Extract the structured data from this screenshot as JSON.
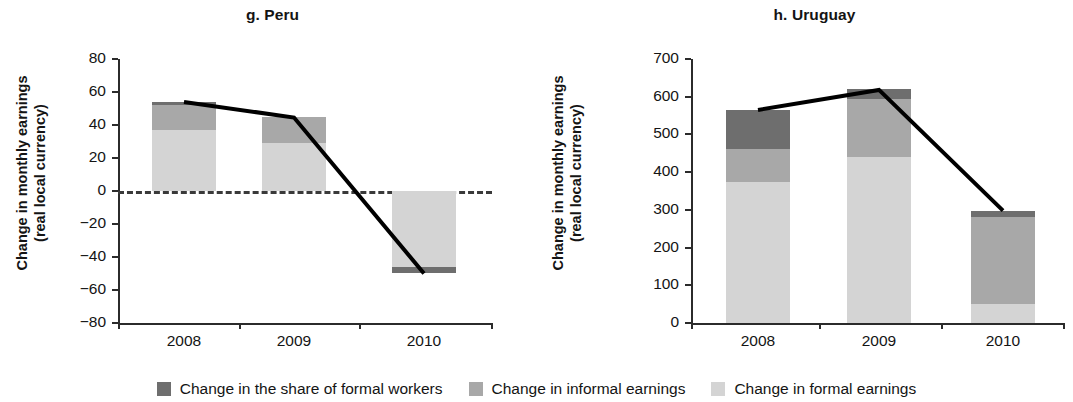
{
  "figure": {
    "panels": [
      {
        "key": "peru",
        "title": "g. Peru",
        "ylabel_line1": "Change in monthly earnings",
        "ylabel_line2": "(real local currency)"
      },
      {
        "key": "uruguay",
        "title": "h. Uruguay",
        "ylabel_line1": "Change in monthly earnings",
        "ylabel_line2": "(real local currency)"
      }
    ],
    "legend": {
      "items": [
        {
          "label": "Change in the share of formal workers",
          "color": "#6e6e6e",
          "key": "share"
        },
        {
          "label": "Change in informal earnings",
          "color": "#a8a8a8",
          "key": "informal"
        },
        {
          "label": "Change in formal earnings",
          "color": "#d4d4d4",
          "key": "formal"
        }
      ]
    }
  },
  "chart_data": [
    {
      "type": "bar",
      "title": "g. Peru",
      "xlabel": "",
      "ylabel": "Change in monthly earnings (real local currency)",
      "categories": [
        "2008",
        "2009",
        "2010"
      ],
      "xtick_labels": [
        "2008",
        "2009",
        "2010"
      ],
      "ytick_labels": [
        "80",
        "60",
        "40",
        "20",
        "0",
        "−20",
        "−40",
        "−60",
        "−80"
      ],
      "yticks": [
        80,
        60,
        40,
        20,
        0,
        -20,
        -40,
        -60,
        -80
      ],
      "ylim": [
        -80,
        80
      ],
      "grid": false,
      "stacked": true,
      "zero_line": true,
      "legend_position": "bottom",
      "series": [
        {
          "name": "Change in formal earnings",
          "color": "#d4d4d4",
          "values": [
            37,
            29,
            -46
          ]
        },
        {
          "name": "Change in informal earnings",
          "color": "#a8a8a8",
          "values": [
            15,
            16,
            0
          ]
        },
        {
          "name": "Change in the share of formal workers",
          "color": "#6e6e6e",
          "values": [
            2,
            0,
            -4
          ]
        }
      ],
      "line_series": {
        "name": "Total change",
        "color": "#000000",
        "values": [
          54,
          44.5,
          -50
        ]
      }
    },
    {
      "type": "bar",
      "title": "h. Uruguay",
      "xlabel": "",
      "ylabel": "Change in monthly earnings (real local currency)",
      "categories": [
        "2008",
        "2009",
        "2010"
      ],
      "xtick_labels": [
        "2008",
        "2009",
        "2010"
      ],
      "ytick_labels": [
        "700",
        "600",
        "500",
        "400",
        "300",
        "200",
        "100",
        "0"
      ],
      "yticks": [
        700,
        600,
        500,
        400,
        300,
        200,
        100,
        0
      ],
      "ylim": [
        0,
        700
      ],
      "grid": false,
      "stacked": true,
      "zero_line": false,
      "legend_position": "bottom",
      "series": [
        {
          "name": "Change in formal earnings",
          "color": "#d4d4d4",
          "values": [
            375,
            441,
            50
          ]
        },
        {
          "name": "Change in informal earnings",
          "color": "#a8a8a8",
          "values": [
            87,
            154,
            230
          ]
        },
        {
          "name": "Change in the share of formal workers",
          "color": "#6e6e6e",
          "values": [
            103,
            25,
            18
          ]
        }
      ],
      "line_series": {
        "name": "Total change",
        "color": "#000000",
        "values": [
          565,
          618,
          298
        ]
      }
    }
  ]
}
